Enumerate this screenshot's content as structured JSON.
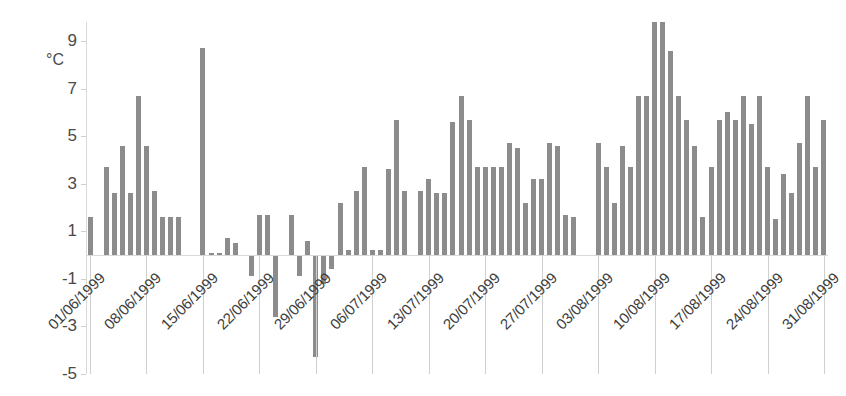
{
  "chart_data": {
    "type": "bar",
    "title": "",
    "subtitle": "",
    "xlabel": "",
    "ylabel": "°C",
    "unit_label": "°C",
    "ylim": [
      -5,
      9.8
    ],
    "ytick_values": [
      9,
      7,
      5,
      3,
      1,
      -1,
      -3,
      -5
    ],
    "ytick_labels": [
      "9",
      "7",
      "5",
      "3",
      "1",
      "-1",
      "-3",
      "-5"
    ],
    "grid": false,
    "legend": "none",
    "bar_color": "#8c8c8c",
    "axis_color": "#d9d9d9",
    "x_tick_interval_days": 7,
    "xtick_labels": [
      "01/06/1999",
      "08/06/1999",
      "15/06/1999",
      "22/06/1999",
      "29/06/1999",
      "06/07/1999",
      "13/07/1999",
      "20/07/1999",
      "27/07/1999",
      "03/08/1999",
      "10/08/1999",
      "17/08/1999",
      "24/08/1999",
      "31/08/1999"
    ],
    "x_start": "01/06/1999",
    "x_end": "31/08/1999",
    "categories": [
      "01/06/1999",
      "02/06/1999",
      "03/06/1999",
      "04/06/1999",
      "05/06/1999",
      "06/06/1999",
      "07/06/1999",
      "08/06/1999",
      "09/06/1999",
      "10/06/1999",
      "11/06/1999",
      "12/06/1999",
      "13/06/1999",
      "14/06/1999",
      "15/06/1999",
      "16/06/1999",
      "17/06/1999",
      "18/06/1999",
      "19/06/1999",
      "20/06/1999",
      "21/06/1999",
      "22/06/1999",
      "23/06/1999",
      "24/06/1999",
      "25/06/1999",
      "26/06/1999",
      "27/06/1999",
      "28/06/1999",
      "29/06/1999",
      "30/06/1999",
      "01/07/1999",
      "02/07/1999",
      "03/07/1999",
      "04/07/1999",
      "05/07/1999",
      "06/07/1999",
      "07/07/1999",
      "08/07/1999",
      "09/07/1999",
      "10/07/1999",
      "11/07/1999",
      "12/07/1999",
      "13/07/1999",
      "14/07/1999",
      "15/07/1999",
      "16/07/1999",
      "17/07/1999",
      "18/07/1999",
      "19/07/1999",
      "20/07/1999",
      "21/07/1999",
      "22/07/1999",
      "23/07/1999",
      "24/07/1999",
      "25/07/1999",
      "26/07/1999",
      "27/07/1999",
      "28/07/1999",
      "29/07/1999",
      "30/07/1999",
      "31/07/1999",
      "01/08/1999",
      "02/08/1999",
      "03/08/1999",
      "04/08/1999",
      "05/08/1999",
      "06/08/1999",
      "07/08/1999",
      "08/08/1999",
      "09/08/1999",
      "10/08/1999",
      "11/08/1999",
      "12/08/1999",
      "13/08/1999",
      "14/08/1999",
      "15/08/1999",
      "16/08/1999",
      "17/08/1999",
      "18/08/1999",
      "19/08/1999",
      "20/08/1999",
      "21/08/1999",
      "22/08/1999",
      "23/08/1999",
      "24/08/1999",
      "25/08/1999",
      "26/08/1999",
      "27/08/1999",
      "28/08/1999",
      "29/08/1999",
      "30/08/1999",
      "31/08/1999"
    ],
    "values": [
      1.6,
      0.0,
      3.7,
      2.6,
      4.6,
      2.6,
      6.7,
      4.6,
      2.7,
      1.6,
      1.6,
      1.6,
      0.0,
      0.0,
      8.7,
      0.1,
      0.1,
      0.7,
      0.5,
      0.0,
      -0.9,
      1.7,
      1.7,
      -2.6,
      0.0,
      1.7,
      -0.9,
      0.6,
      -4.3,
      -1.2,
      -0.6,
      2.2,
      0.2,
      2.7,
      3.7,
      0.2,
      0.2,
      3.6,
      5.7,
      2.7,
      0.0,
      2.7,
      3.2,
      2.6,
      2.6,
      5.6,
      6.7,
      5.7,
      3.7,
      3.7,
      3.7,
      3.7,
      4.7,
      4.5,
      2.2,
      3.2,
      3.2,
      4.7,
      4.6,
      1.7,
      1.6,
      0.0,
      0.0,
      4.7,
      3.7,
      2.2,
      4.6,
      3.7,
      6.7,
      6.7,
      9.8,
      9.8,
      8.6,
      6.7,
      5.7,
      4.6,
      1.6,
      3.7,
      5.7,
      6.0,
      5.7,
      6.7,
      5.5,
      6.7,
      3.7,
      1.5,
      3.4,
      2.6,
      4.7,
      6.7,
      3.7,
      5.7
    ]
  }
}
